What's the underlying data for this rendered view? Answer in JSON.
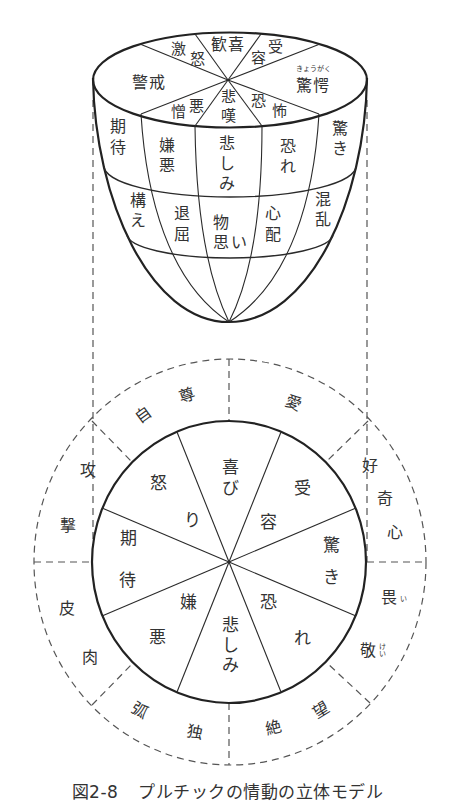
{
  "figure": {
    "caption": {
      "number": "図2-8",
      "title": "プルチックの情動の立体モデル"
    },
    "solid_model": {
      "top_face": [
        {
          "label": "歓喜"
        },
        {
          "label": "受容",
          "chars": [
            "受",
            "容"
          ]
        },
        {
          "label": "驚愕",
          "ruby": "きょうがく"
        },
        {
          "label": "恐怖",
          "chars": [
            "恐",
            "怖"
          ]
        },
        {
          "label": "悲嘆",
          "chars": [
            "悲",
            "嘆"
          ]
        },
        {
          "label": "憎悪",
          "chars": [
            "憎",
            "悪"
          ]
        },
        {
          "label": "警戒"
        },
        {
          "label": "激怒",
          "chars": [
            "激",
            "怒"
          ]
        }
      ],
      "middle_layer": [
        {
          "label": "期待",
          "chars": [
            "期",
            "待"
          ]
        },
        {
          "label": "嫌悪",
          "chars": [
            "嫌",
            "悪"
          ]
        },
        {
          "label": "悲しみ",
          "chars": [
            "悲",
            "し",
            "み"
          ]
        },
        {
          "label": "恐れ",
          "chars": [
            "恐",
            "れ"
          ]
        },
        {
          "label": "驚き",
          "chars": [
            "驚",
            "き"
          ]
        }
      ],
      "lower_layer": [
        {
          "label": "構え",
          "chars": [
            "構",
            "え"
          ]
        },
        {
          "label": "退屈",
          "chars": [
            "退",
            "屈"
          ]
        },
        {
          "label": "物思い",
          "chars": [
            "物",
            "思",
            "い"
          ]
        },
        {
          "label": "心配",
          "chars": [
            "心",
            "配"
          ]
        },
        {
          "label": "混乱",
          "chars": [
            "混",
            "乱"
          ]
        }
      ]
    },
    "circle": {
      "primary_emotions": [
        {
          "label": "喜び",
          "chars": [
            "喜",
            "び"
          ]
        },
        {
          "label": "受容",
          "chars": [
            "受",
            "容"
          ]
        },
        {
          "label": "驚き",
          "chars": [
            "驚",
            "き"
          ]
        },
        {
          "label": "恐れ",
          "chars": [
            "恐",
            "れ"
          ]
        },
        {
          "label": "悲しみ",
          "chars": [
            "悲",
            "し",
            "み"
          ]
        },
        {
          "label": "嫌悪",
          "chars": [
            "嫌",
            "悪"
          ]
        },
        {
          "label": "期待",
          "chars": [
            "期",
            "待"
          ]
        },
        {
          "label": "怒り",
          "chars": [
            "怒",
            "り"
          ]
        }
      ],
      "dyads": [
        {
          "label": "愛",
          "chars": [
            "愛"
          ]
        },
        {
          "label": "好奇心",
          "chars": [
            "好",
            "奇",
            "心"
          ]
        },
        {
          "label": "畏敬",
          "chars": [
            "畏",
            "敬"
          ],
          "ruby": [
            "い",
            "けい"
          ]
        },
        {
          "label": "絶望",
          "chars": [
            "絶",
            "望"
          ]
        },
        {
          "label": "弧独",
          "chars": [
            "弧",
            "独"
          ]
        },
        {
          "label": "皮肉",
          "chars": [
            "皮",
            "肉"
          ]
        },
        {
          "label": "攻撃",
          "chars": [
            "攻",
            "撃"
          ]
        },
        {
          "label": "自尊",
          "chars": [
            "自",
            "尊"
          ]
        }
      ]
    }
  }
}
